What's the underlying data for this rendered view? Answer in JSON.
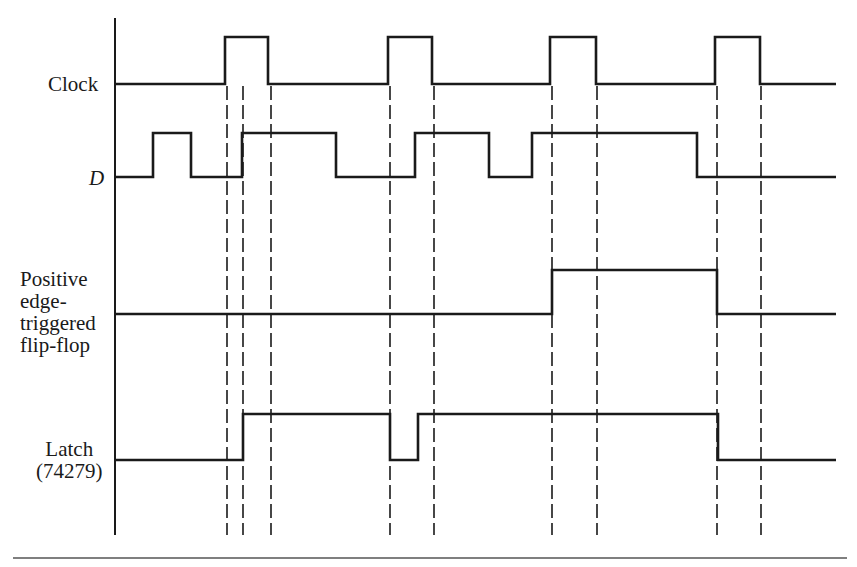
{
  "diagram": {
    "colors": {
      "ink": "#1a1a1a",
      "background": "#ffffff"
    },
    "axis": {
      "x": 115,
      "y_top": 18,
      "y_bottom": 535
    },
    "bottom_rule": {
      "x1": 13,
      "x2": 847,
      "y": 558
    },
    "x_end": 836,
    "dashed_lines": {
      "y_top": 86,
      "y_bottom": 535,
      "x": [
        227,
        243,
        271,
        390,
        434,
        552,
        597,
        717,
        761
      ]
    },
    "signals": [
      {
        "name": "Clock",
        "label": "Clock",
        "label_style": "normal",
        "label_pos": {
          "left": 48,
          "top": 73
        },
        "y_low": 84,
        "y_high": 37,
        "initial": 0,
        "transitions": [
          225,
          268,
          388,
          432,
          550,
          596,
          715,
          760
        ]
      },
      {
        "name": "D",
        "label": "D",
        "label_style": "italic",
        "label_pos": {
          "left": 89,
          "top": 167
        },
        "y_low": 177,
        "y_high": 133,
        "initial": 0,
        "transitions": [
          153,
          191,
          242,
          336,
          415,
          489,
          532,
          697
        ]
      },
      {
        "name": "Positive edge-triggered flip-flop",
        "label": "Positive\nedge-\ntriggered\nflip-flop",
        "label_style": "multi",
        "label_pos": {
          "left": 20,
          "top": 268
        },
        "y_low": 314,
        "y_high": 270,
        "initial": 0,
        "transitions": [
          552,
          717
        ]
      },
      {
        "name": "Latch (74279)",
        "label": "Latch\n(74279)",
        "label_style": "multi-center",
        "label_pos": {
          "left": 36,
          "top": 438
        },
        "y_low": 460,
        "y_high": 414,
        "initial": 0,
        "transitions": [
          243,
          390,
          418,
          718
        ]
      }
    ]
  }
}
